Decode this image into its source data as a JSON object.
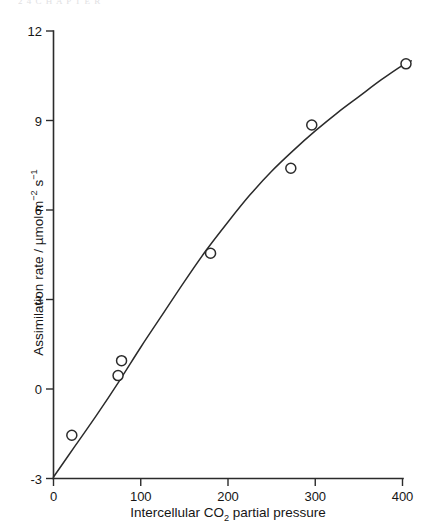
{
  "page": {
    "cropped_header_text": "2 4   C H A P T E R",
    "background_color": "#ffffff",
    "ink_color": "#2b2b2b"
  },
  "chart_data": {
    "type": "scatter",
    "title": "",
    "subtitle": "",
    "xlabel": "Intercellular CO2 partial pressure",
    "xlabel_parts": {
      "before_sub": "Intercellular CO",
      "sub": "2",
      "after_sub": " partial pressure"
    },
    "ylabel": "Assimilation rate / µmol m-2 s-1",
    "ylabel_parts": {
      "before": "Assimilation rate / µmol m",
      "sup1": "−2",
      "middle": " s",
      "sup2": "−1"
    },
    "xlim": [
      0,
      400
    ],
    "ylim": [
      -3,
      12
    ],
    "xticks": [
      0,
      100,
      200,
      300,
      400
    ],
    "xtick_labels": [
      "0",
      "100",
      "200",
      "300",
      "400"
    ],
    "yticks": [
      -3,
      0,
      3,
      6,
      9,
      12
    ],
    "ytick_labels": [
      "-3",
      "0",
      "3",
      "6",
      "9",
      "12"
    ],
    "grid": false,
    "legend": null,
    "marker_style": "open-circle",
    "marker_radius_px": 5,
    "points": [
      {
        "x": 21,
        "y": -1.55
      },
      {
        "x": 74,
        "y": 0.45
      },
      {
        "x": 78,
        "y": 0.95
      },
      {
        "x": 180,
        "y": 4.55
      },
      {
        "x": 272,
        "y": 7.4
      },
      {
        "x": 296,
        "y": 8.85
      },
      {
        "x": 404,
        "y": 10.9
      }
    ],
    "fitted_curve": [
      {
        "x": 0,
        "y": -2.95
      },
      {
        "x": 25,
        "y": -1.9
      },
      {
        "x": 50,
        "y": -0.85
      },
      {
        "x": 75,
        "y": 0.25
      },
      {
        "x": 100,
        "y": 1.4
      },
      {
        "x": 125,
        "y": 2.5
      },
      {
        "x": 150,
        "y": 3.6
      },
      {
        "x": 175,
        "y": 4.65
      },
      {
        "x": 200,
        "y": 5.6
      },
      {
        "x": 225,
        "y": 6.5
      },
      {
        "x": 250,
        "y": 7.3
      },
      {
        "x": 275,
        "y": 8.0
      },
      {
        "x": 300,
        "y": 8.65
      },
      {
        "x": 325,
        "y": 9.25
      },
      {
        "x": 350,
        "y": 9.8
      },
      {
        "x": 375,
        "y": 10.35
      },
      {
        "x": 400,
        "y": 10.85
      },
      {
        "x": 410,
        "y": 11.0
      }
    ]
  }
}
